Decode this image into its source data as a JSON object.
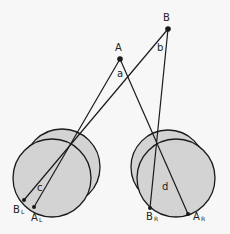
{
  "diagram": {
    "colors": {
      "eye_fill": "#d3d3d3",
      "stroke": "#1a1a1a",
      "background": "#f7f7f7"
    },
    "points": {
      "A": {
        "label": "A"
      },
      "B": {
        "label": "B"
      },
      "BL": {
        "label": "B",
        "sub": "L"
      },
      "AL": {
        "label": "A",
        "sub": "L"
      },
      "BR": {
        "label": "B",
        "sub": "R"
      },
      "AR": {
        "label": "A",
        "sub": "R"
      }
    },
    "angles": {
      "a": "a",
      "b": "b",
      "c": "c",
      "d": "d"
    },
    "eyes": [
      {
        "name": "left-eye"
      },
      {
        "name": "right-eye"
      }
    ]
  }
}
